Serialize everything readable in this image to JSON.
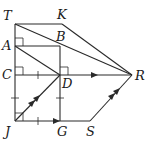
{
  "diagram": {
    "type": "geometry-figure",
    "points": [
      {
        "name": "T",
        "x": 15,
        "y": 24,
        "label_x": 3,
        "label_y": 20
      },
      {
        "name": "K",
        "x": 62,
        "y": 24,
        "label_x": 57,
        "label_y": 19
      },
      {
        "name": "A",
        "x": 15,
        "y": 46,
        "label_x": 2,
        "label_y": 50
      },
      {
        "name": "B",
        "x": 60,
        "y": 46,
        "label_x": 56,
        "label_y": 41
      },
      {
        "name": "C",
        "x": 15,
        "y": 75,
        "label_x": 2,
        "label_y": 79
      },
      {
        "name": "D",
        "x": 60,
        "y": 75,
        "label_x": 62,
        "label_y": 88
      },
      {
        "name": "R",
        "x": 132,
        "y": 75,
        "label_x": 135,
        "label_y": 80
      },
      {
        "name": "J",
        "x": 15,
        "y": 121,
        "label_x": 5,
        "label_y": 136
      },
      {
        "name": "G",
        "x": 60,
        "y": 121,
        "label_x": 57,
        "label_y": 136
      },
      {
        "name": "S",
        "x": 90,
        "y": 121,
        "label_x": 86,
        "label_y": 136
      }
    ],
    "segments": [
      "TK",
      "TJ",
      "TR",
      "KR",
      "AB",
      "AD",
      "BR",
      "BG",
      "CD",
      "DR",
      "JD",
      "JG",
      "GS",
      "SR"
    ],
    "right_angles": [
      "A",
      "C",
      "D",
      "J"
    ],
    "tick_marks": [
      "CD",
      "DG",
      "JG",
      "CJ"
    ],
    "parallel_arrows": {
      "single": [
        "DR",
        "JG"
      ],
      "double": [
        "JD",
        "SR"
      ]
    },
    "colors": {
      "stroke": "#2a2a2a",
      "background": "#ffffff"
    }
  }
}
